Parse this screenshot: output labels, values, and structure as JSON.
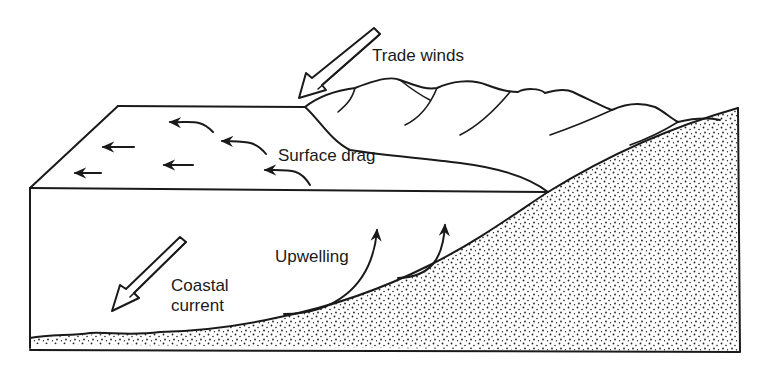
{
  "diagram": {
    "labels": {
      "trade_winds": "Trade winds",
      "surface_drag": "Surface drag",
      "upwelling": "Upwelling",
      "coastal_current_line1": "Coastal",
      "coastal_current_line2": "current"
    },
    "elements": [
      "trade-winds-arrow",
      "coastal-current-arrow",
      "surface-drag-arrows",
      "upwelling-arrows",
      "ocean-block",
      "mountains",
      "stippled-seabed-slope"
    ],
    "colors": {
      "ink": "#1a1a1a",
      "background": "#ffffff"
    }
  }
}
